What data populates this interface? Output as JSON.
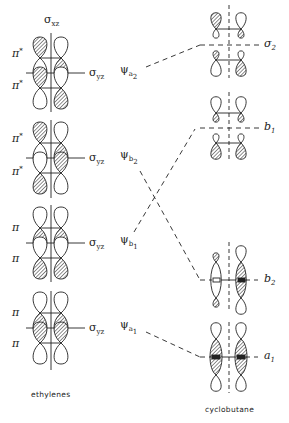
{
  "figure": {
    "left_column_caption": "ethylenes",
    "right_column_caption": "cyclobutane",
    "mirror_plane_top": {
      "symbol": "σ",
      "subscript": "xz"
    },
    "colors": {
      "ink": "#222222",
      "hatch": "#333333",
      "background": "#ffffff"
    }
  },
  "ethylene_blocks": [
    {
      "top_label": "π",
      "top_sup": "*",
      "bottom_label": "π",
      "bottom_sup": "*",
      "plane": "σ",
      "plane_sub": "yz",
      "psi": "ψ",
      "psi_sub": "a",
      "psi_subsub": "2"
    },
    {
      "top_label": "π",
      "top_sup": "*",
      "bottom_label": "π",
      "bottom_sup": "*",
      "plane": "σ",
      "plane_sub": "yz",
      "psi": "ψ",
      "psi_sub": "b",
      "psi_subsub": "2"
    },
    {
      "top_label": "π",
      "top_sup": "",
      "bottom_label": "π",
      "bottom_sup": "",
      "plane": "σ",
      "plane_sub": "yz",
      "psi": "ψ",
      "psi_sub": "b",
      "psi_subsub": "1"
    },
    {
      "top_label": "π",
      "top_sup": "",
      "bottom_label": "π",
      "bottom_sup": "",
      "plane": "σ",
      "plane_sub": "yz",
      "psi": "ψ",
      "psi_sub": "a",
      "psi_subsub": "1"
    }
  ],
  "cyclobutane_levels": [
    {
      "label": "σ",
      "sub": "2"
    },
    {
      "label": "b",
      "sub": "1"
    },
    {
      "label": "b",
      "sub": "2"
    },
    {
      "label": "a",
      "sub": "1"
    }
  ],
  "correlations": [
    {
      "from": "ψa2",
      "to": "σ2"
    },
    {
      "from": "ψb2",
      "to": "b2"
    },
    {
      "from": "ψb1",
      "to": "b1"
    },
    {
      "from": "ψa1",
      "to": "a1"
    }
  ]
}
